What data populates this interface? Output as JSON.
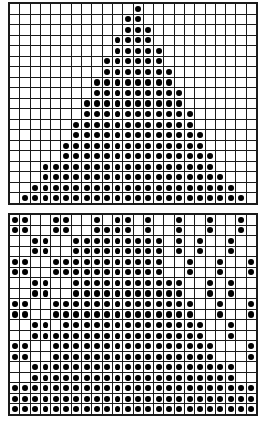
{
  "figure": {
    "background_color": "#ffffff",
    "grid_line_color": "#1a1a1a",
    "dot_color": "#000000",
    "cell_color": "#ffffff"
  },
  "chart_data": {
    "type": "heatmap",
    "title": "",
    "xlabel": "",
    "ylabel": "",
    "grid": true,
    "legend": "none",
    "panels": [
      {
        "name": "top-panel",
        "rows": 19,
        "cols": 24,
        "x": 8,
        "y": 2,
        "width": 250,
        "height": 203,
        "values": [
          [
            0,
            0,
            0,
            0,
            0,
            0,
            0,
            0,
            0,
            0,
            0,
            0,
            1,
            0,
            0,
            0,
            0,
            0,
            0,
            0,
            0,
            0,
            0,
            0
          ],
          [
            0,
            0,
            0,
            0,
            0,
            0,
            0,
            0,
            0,
            0,
            0,
            1,
            1,
            0,
            0,
            0,
            0,
            0,
            0,
            0,
            0,
            0,
            0,
            0
          ],
          [
            0,
            0,
            0,
            0,
            0,
            0,
            0,
            0,
            0,
            0,
            0,
            1,
            1,
            1,
            0,
            0,
            0,
            0,
            0,
            0,
            0,
            0,
            0,
            0
          ],
          [
            0,
            0,
            0,
            0,
            0,
            0,
            0,
            0,
            0,
            0,
            1,
            1,
            1,
            1,
            0,
            0,
            0,
            0,
            0,
            0,
            0,
            0,
            0,
            0
          ],
          [
            0,
            0,
            0,
            0,
            0,
            0,
            0,
            0,
            0,
            0,
            1,
            1,
            1,
            1,
            1,
            0,
            0,
            0,
            0,
            0,
            0,
            0,
            0,
            0
          ],
          [
            0,
            0,
            0,
            0,
            0,
            0,
            0,
            0,
            0,
            1,
            1,
            1,
            1,
            1,
            1,
            0,
            0,
            0,
            0,
            0,
            0,
            0,
            0,
            0
          ],
          [
            0,
            0,
            0,
            0,
            0,
            0,
            0,
            0,
            0,
            1,
            1,
            1,
            1,
            1,
            1,
            1,
            0,
            0,
            0,
            0,
            0,
            0,
            0,
            0
          ],
          [
            0,
            0,
            0,
            0,
            0,
            0,
            0,
            0,
            1,
            1,
            1,
            1,
            1,
            1,
            1,
            1,
            0,
            0,
            0,
            0,
            0,
            0,
            0,
            0
          ],
          [
            0,
            0,
            0,
            0,
            0,
            0,
            0,
            0,
            1,
            1,
            1,
            1,
            1,
            1,
            1,
            1,
            1,
            0,
            0,
            0,
            0,
            0,
            0,
            0
          ],
          [
            0,
            0,
            0,
            0,
            0,
            0,
            0,
            1,
            1,
            1,
            1,
            1,
            1,
            1,
            1,
            1,
            1,
            0,
            0,
            0,
            0,
            0,
            0,
            0
          ],
          [
            0,
            0,
            0,
            0,
            0,
            0,
            0,
            1,
            1,
            1,
            1,
            1,
            1,
            1,
            1,
            1,
            1,
            1,
            0,
            0,
            0,
            0,
            0,
            0
          ],
          [
            0,
            0,
            0,
            0,
            0,
            0,
            1,
            1,
            1,
            1,
            1,
            1,
            1,
            1,
            1,
            1,
            1,
            1,
            0,
            0,
            0,
            0,
            0,
            0
          ],
          [
            0,
            0,
            0,
            0,
            0,
            0,
            1,
            1,
            1,
            1,
            1,
            1,
            1,
            1,
            1,
            1,
            1,
            1,
            1,
            0,
            0,
            0,
            0,
            0
          ],
          [
            0,
            0,
            0,
            0,
            0,
            1,
            1,
            1,
            1,
            1,
            1,
            1,
            1,
            1,
            1,
            1,
            1,
            1,
            1,
            0,
            0,
            0,
            0,
            0
          ],
          [
            0,
            0,
            0,
            0,
            0,
            1,
            1,
            1,
            1,
            1,
            1,
            1,
            1,
            1,
            1,
            1,
            1,
            1,
            1,
            1,
            0,
            0,
            0,
            0
          ],
          [
            0,
            0,
            0,
            1,
            1,
            1,
            1,
            1,
            1,
            1,
            1,
            1,
            1,
            1,
            1,
            1,
            1,
            1,
            1,
            1,
            0,
            0,
            0,
            0
          ],
          [
            0,
            0,
            0,
            1,
            1,
            1,
            1,
            1,
            1,
            1,
            1,
            1,
            1,
            1,
            1,
            1,
            1,
            1,
            1,
            1,
            1,
            0,
            0,
            0
          ],
          [
            0,
            0,
            1,
            1,
            1,
            1,
            1,
            1,
            1,
            1,
            1,
            1,
            1,
            1,
            1,
            1,
            1,
            1,
            1,
            1,
            1,
            1,
            0,
            0
          ],
          [
            0,
            1,
            1,
            1,
            1,
            1,
            1,
            1,
            1,
            1,
            1,
            1,
            1,
            1,
            1,
            1,
            1,
            1,
            1,
            1,
            1,
            1,
            1,
            0
          ]
        ]
      },
      {
        "name": "bottom-panel",
        "rows": 19,
        "cols": 24,
        "x": 8,
        "y": 213,
        "width": 250,
        "height": 203,
        "values": [
          [
            1,
            1,
            0,
            0,
            1,
            1,
            0,
            0,
            1,
            0,
            1,
            1,
            0,
            1,
            0,
            0,
            1,
            0,
            0,
            1,
            0,
            0,
            1,
            0
          ],
          [
            1,
            1,
            0,
            0,
            1,
            1,
            0,
            0,
            1,
            1,
            1,
            1,
            0,
            1,
            0,
            0,
            1,
            0,
            0,
            1,
            0,
            0,
            1,
            0
          ],
          [
            0,
            0,
            1,
            1,
            0,
            0,
            1,
            1,
            1,
            1,
            1,
            1,
            1,
            1,
            1,
            0,
            1,
            0,
            1,
            0,
            0,
            1,
            0,
            0
          ],
          [
            0,
            0,
            1,
            1,
            0,
            0,
            1,
            1,
            1,
            1,
            1,
            1,
            1,
            1,
            1,
            0,
            1,
            0,
            1,
            0,
            0,
            1,
            0,
            0
          ],
          [
            1,
            1,
            0,
            0,
            1,
            1,
            1,
            1,
            1,
            1,
            1,
            1,
            1,
            1,
            1,
            0,
            0,
            1,
            0,
            0,
            1,
            0,
            0,
            1
          ],
          [
            1,
            1,
            0,
            0,
            1,
            1,
            1,
            1,
            1,
            1,
            1,
            1,
            1,
            1,
            1,
            0,
            0,
            1,
            0,
            0,
            1,
            0,
            0,
            1
          ],
          [
            0,
            0,
            1,
            1,
            0,
            0,
            1,
            1,
            1,
            1,
            1,
            1,
            1,
            1,
            1,
            1,
            1,
            0,
            0,
            1,
            0,
            1,
            0,
            0
          ],
          [
            0,
            0,
            1,
            1,
            0,
            0,
            1,
            1,
            1,
            1,
            1,
            1,
            1,
            1,
            1,
            1,
            1,
            0,
            0,
            1,
            0,
            1,
            0,
            0
          ],
          [
            1,
            1,
            0,
            0,
            1,
            1,
            1,
            1,
            1,
            1,
            1,
            1,
            1,
            1,
            1,
            1,
            1,
            1,
            0,
            0,
            1,
            0,
            0,
            1
          ],
          [
            1,
            1,
            0,
            0,
            1,
            1,
            1,
            1,
            1,
            1,
            1,
            1,
            1,
            1,
            1,
            1,
            1,
            1,
            0,
            0,
            1,
            0,
            0,
            1
          ],
          [
            0,
            0,
            1,
            1,
            0,
            1,
            1,
            1,
            1,
            1,
            1,
            1,
            1,
            1,
            1,
            1,
            1,
            1,
            1,
            0,
            0,
            1,
            0,
            0
          ],
          [
            0,
            0,
            1,
            1,
            1,
            1,
            1,
            1,
            1,
            1,
            1,
            1,
            1,
            1,
            1,
            1,
            1,
            1,
            1,
            0,
            0,
            1,
            0,
            0
          ],
          [
            1,
            1,
            0,
            0,
            1,
            1,
            1,
            1,
            1,
            1,
            1,
            1,
            1,
            1,
            1,
            1,
            1,
            1,
            1,
            1,
            0,
            0,
            0,
            1
          ],
          [
            1,
            1,
            0,
            0,
            1,
            1,
            1,
            1,
            1,
            1,
            1,
            1,
            1,
            1,
            1,
            1,
            1,
            1,
            1,
            1,
            0,
            0,
            0,
            1
          ],
          [
            0,
            0,
            1,
            1,
            1,
            1,
            1,
            1,
            1,
            1,
            1,
            1,
            1,
            1,
            1,
            1,
            1,
            1,
            1,
            1,
            1,
            1,
            0,
            0
          ],
          [
            0,
            0,
            1,
            1,
            1,
            1,
            1,
            1,
            1,
            1,
            1,
            1,
            1,
            1,
            1,
            1,
            1,
            1,
            1,
            1,
            1,
            1,
            0,
            0
          ],
          [
            1,
            1,
            1,
            1,
            1,
            1,
            1,
            1,
            1,
            1,
            1,
            1,
            1,
            1,
            1,
            1,
            1,
            1,
            1,
            1,
            1,
            1,
            1,
            1
          ],
          [
            1,
            1,
            1,
            1,
            1,
            1,
            1,
            1,
            1,
            1,
            1,
            1,
            1,
            1,
            1,
            1,
            1,
            1,
            1,
            1,
            1,
            1,
            1,
            1
          ],
          [
            1,
            1,
            1,
            1,
            1,
            1,
            1,
            1,
            1,
            1,
            1,
            1,
            1,
            1,
            1,
            1,
            1,
            1,
            1,
            1,
            1,
            1,
            1,
            1
          ]
        ]
      }
    ]
  }
}
